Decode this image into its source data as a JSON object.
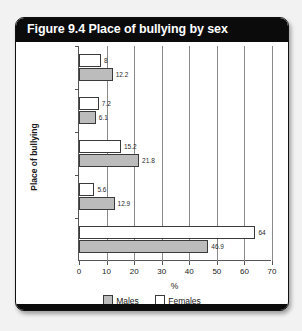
{
  "figure": {
    "title": "Figure 9.4 Place of bullying by sex"
  },
  "legend": {
    "items": [
      {
        "label": "Males",
        "color": "#bcbcbc",
        "icon": "square-swatch-icon"
      },
      {
        "label": "Females",
        "color": "#ffffff",
        "icon": "square-swatch-icon"
      }
    ]
  },
  "chart_data": {
    "type": "bar",
    "orientation": "horizontal",
    "title": "Figure 9.4 Place of bullying by sex",
    "xlabel": "%",
    "ylabel": "Place of bullying",
    "xlim": [
      0,
      70
    ],
    "xticks": [
      0,
      10,
      20,
      30,
      40,
      50,
      60,
      70
    ],
    "grid": "vertical",
    "legend_position": "bottom-center",
    "categories": [
      "Near\nhome",
      "Work",
      "Other",
      "On way to\ncollege/\nschool",
      "At college/\nschool"
    ],
    "series": [
      {
        "name": "Females",
        "color": "#ffffff",
        "values": [
          8,
          7.2,
          15.2,
          5.6,
          64
        ]
      },
      {
        "name": "Males",
        "color": "#bcbcbc",
        "values": [
          12.2,
          6.1,
          21.8,
          12.9,
          46.9
        ]
      }
    ],
    "value_labels": {
      "Females": [
        "8",
        "7.2",
        "15.2",
        "5.6",
        "64"
      ],
      "Males": [
        "12.2",
        "6.1",
        "21.8",
        "12.9",
        "46.9"
      ]
    }
  }
}
